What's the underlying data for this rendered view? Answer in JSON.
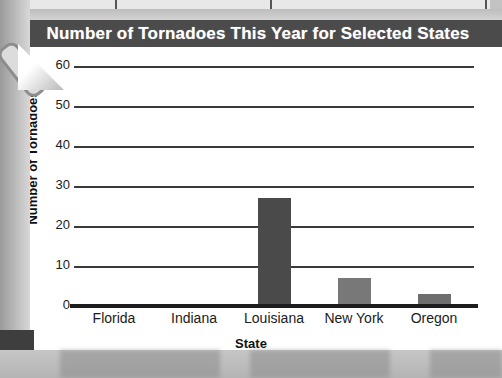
{
  "chart_data": {
    "type": "bar",
    "title": "Number of Tornadoes This Year for Selected States",
    "xlabel": "State",
    "ylabel": "Number of Tornadoes",
    "categories": [
      "Florida",
      "Indiana",
      "Louisiana",
      "New York",
      "Oregon"
    ],
    "values": [
      0,
      0,
      27,
      7,
      3
    ],
    "ylim": [
      0,
      60
    ],
    "yticks": [
      0,
      10,
      20,
      30,
      40,
      50,
      60
    ],
    "ytick_labels": [
      "0",
      "10",
      "20",
      "30",
      "40",
      "50",
      "60"
    ],
    "grid": true,
    "legend": null,
    "bar_colors": [
      "#4a4a4a",
      "#4a4a4a",
      "#4a4a4a",
      "#787878",
      "#6e6e6e"
    ]
  },
  "style": {
    "title_bar_bg": "#4b4b4b",
    "title_text_color": "#ffffff",
    "plot_bg": "#ffffff",
    "gridline_color": "#3a3a3a",
    "axis_color": "#1d1d1d",
    "page_bg": "#c3c3c3"
  }
}
